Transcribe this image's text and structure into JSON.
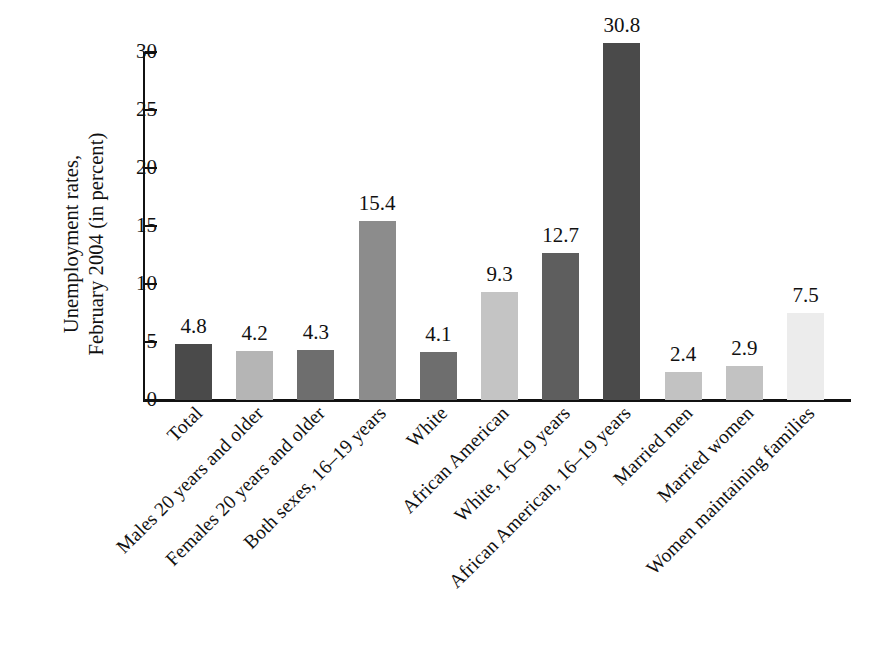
{
  "chart_data": {
    "type": "bar",
    "title": "",
    "subtitle": "",
    "xlabel": "",
    "ylabel": "Unemployment rates, February 2004 (in percent)",
    "ylabel_lines": [
      "Unemployment rates,",
      "February 2004 (in percent)"
    ],
    "ylim": [
      0,
      30
    ],
    "yticks": [
      0,
      5,
      10,
      15,
      20,
      25,
      30
    ],
    "ytick_labels": [
      "0",
      "5",
      "10",
      "15",
      "20",
      "25",
      "30"
    ],
    "grid": false,
    "legend": "none",
    "categories": [
      "Total",
      "Males 20 years and older",
      "Females 20 years and older",
      "Both sexes, 16–19 years",
      "White",
      "African American",
      "White, 16–19 years",
      "African American, 16–19 years",
      "Married men",
      "Married women",
      "Women maintaining families"
    ],
    "values": [
      4.8,
      4.2,
      4.3,
      15.4,
      4.1,
      9.3,
      12.7,
      30.8,
      2.4,
      2.9,
      7.5
    ],
    "value_labels": [
      "4.8",
      "4.2",
      "4.3",
      "15.4",
      "4.1",
      "9.3",
      "12.7",
      "30.8",
      "2.4",
      "2.9",
      "7.5"
    ],
    "bar_colors": [
      "#4a4a4a",
      "#b5b5b5",
      "#6e6e6e",
      "#8c8c8c",
      "#6e6e6e",
      "#c4c4c4",
      "#5e5e5e",
      "#4a4a4a",
      "#c2c2c2",
      "#c2c2c2",
      "#ececec"
    ]
  },
  "axis": {
    "line_color": "#111111"
  }
}
